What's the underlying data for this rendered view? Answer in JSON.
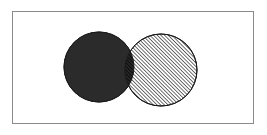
{
  "figure": {
    "title": "Venn diagram of two overlapping sets",
    "type": "venn-2-set",
    "width": 267,
    "height": 135,
    "background_color": "#ffffff"
  },
  "frame": {
    "name": "diagram-border",
    "x": 12,
    "y": 11,
    "width": 242,
    "height": 113,
    "border_color": "#8a8a8a",
    "border_width": 1,
    "fill_color": "#ffffff"
  },
  "sets": [
    {
      "id": "left-set",
      "label": "A",
      "fill_style": "solid",
      "fill_color": "#2b2b2b",
      "stroke_color": "#1a1a1a",
      "center_x": 99,
      "center_y": 67,
      "radius": 35
    },
    {
      "id": "right-set",
      "label": "B",
      "fill_style": "diagonal-hatch",
      "fill_color": "#ffffff",
      "hatch_color": "#1a1a1a",
      "hatch_angle_deg": 45,
      "hatch_spacing": 2,
      "stroke_color": "#1a1a1a",
      "center_x": 161,
      "center_y": 70,
      "radius": 36
    }
  ],
  "intersection": {
    "id": "intersection-region",
    "label": "A ∩ B",
    "fill_style": "solid-with-hatch-overlay",
    "fill_color": "#1b1b1b",
    "hatch_color": "#000000"
  },
  "colors": {
    "solid_dark": "#2b2b2b",
    "hatch_dark": "#1a1a1a",
    "border_gray": "#8a8a8a",
    "page_white": "#ffffff"
  }
}
